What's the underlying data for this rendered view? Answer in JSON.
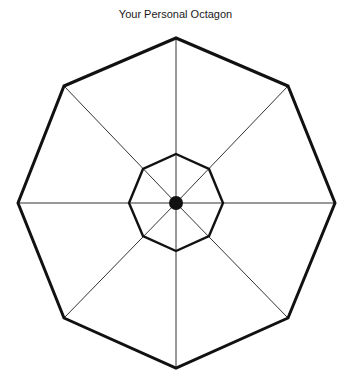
{
  "diagram": {
    "title": "Your Personal Octagon",
    "center": [
      176,
      203
    ],
    "outer_octagon": {
      "points": [
        [
          176,
          38
        ],
        [
          288,
          86
        ],
        [
          335,
          203
        ],
        [
          288,
          318
        ],
        [
          176,
          368
        ],
        [
          64,
          318
        ],
        [
          18,
          203
        ],
        [
          64,
          86
        ]
      ],
      "stroke_width": 3
    },
    "inner_octagon": {
      "points": [
        [
          176,
          154
        ],
        [
          209,
          169
        ],
        [
          223,
          203
        ],
        [
          209,
          236
        ],
        [
          176,
          251
        ],
        [
          143,
          236
        ],
        [
          129,
          203
        ],
        [
          143,
          169
        ]
      ],
      "stroke_width": 2.4
    },
    "spokes": 8,
    "center_dot_radius": 7,
    "colors": {
      "line": "#111111",
      "background": "#ffffff"
    }
  }
}
